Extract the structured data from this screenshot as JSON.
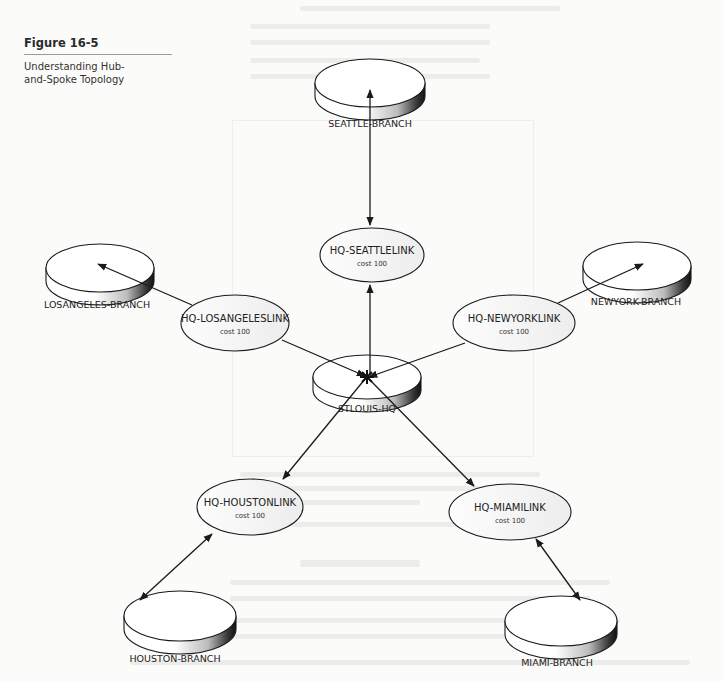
{
  "figure": {
    "number": "Figure 16-5",
    "caption": "Understanding Hub-and-Spoke Topology"
  },
  "hub": {
    "id": "stlouis-hq",
    "label": "STLOUIS-HQ"
  },
  "branches": [
    {
      "id": "seattle",
      "label": "SEATTLE-BRANCH"
    },
    {
      "id": "losangeles",
      "label": "LOSANGELES-BRANCH"
    },
    {
      "id": "newyork",
      "label": "NEWYORK-BRANCH"
    },
    {
      "id": "houston",
      "label": "HOUSTON-BRANCH"
    },
    {
      "id": "miami",
      "label": "MIAMI-BRANCH"
    }
  ],
  "links": [
    {
      "id": "seattle",
      "label": "HQ-SEATTLELINK",
      "cost": "cost 100"
    },
    {
      "id": "losangeles",
      "label": "HQ-LOSANGELESLINK",
      "cost": "cost 100"
    },
    {
      "id": "newyork",
      "label": "HQ-NEWYORKLINK",
      "cost": "cost 100"
    },
    {
      "id": "houston",
      "label": "HQ-HOUSTONLINK",
      "cost": "cost 100"
    },
    {
      "id": "miami",
      "label": "HQ-MIAMILINK",
      "cost": "cost 100"
    }
  ],
  "colors": {
    "stroke": "#1a1a1a",
    "fill": "#ffffff",
    "rim_dark": "#3a3a3a",
    "page": "#fbfbfa"
  }
}
